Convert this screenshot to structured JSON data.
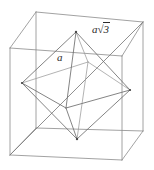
{
  "figure": {
    "background_color": "#ffffff",
    "line_color": "#7c7c7c",
    "label_color": "#2b2b2b",
    "width": 154,
    "height": 170,
    "labels": {
      "edge": {
        "name": "edge-length-label",
        "text": "a",
        "meaning": "octahedron edge length",
        "x": 57,
        "y": 52
      },
      "diagonal": {
        "name": "space-diagonal-label",
        "variable": "a",
        "radical_sign": "√",
        "radicand": "3",
        "text": "a√3",
        "meaning": "cube space diagonal",
        "x": 92,
        "y": 24
      }
    },
    "geometry": {
      "cube": {
        "name": "cube",
        "vertices": {
          "front_bottom_left": [
            10,
            155
          ],
          "front_bottom_right": [
            122,
            160
          ],
          "front_top_right": [
            122,
            56
          ],
          "front_top_left": [
            10,
            48
          ],
          "back_bottom_left": [
            36,
            128
          ],
          "back_bottom_right": [
            143,
            131
          ],
          "back_top_right": [
            143,
            22
          ],
          "back_top_left": [
            36,
            12
          ]
        },
        "edges": [
          [
            "front_bottom_left",
            "front_bottom_right"
          ],
          [
            "front_bottom_right",
            "front_top_right"
          ],
          [
            "front_top_right",
            "front_top_left"
          ],
          [
            "front_top_left",
            "front_bottom_left"
          ],
          [
            "back_bottom_left",
            "back_bottom_right"
          ],
          [
            "back_bottom_right",
            "back_top_right"
          ],
          [
            "back_top_right",
            "back_top_left"
          ],
          [
            "back_top_left",
            "back_bottom_left"
          ],
          [
            "front_bottom_left",
            "back_bottom_left"
          ],
          [
            "front_bottom_right",
            "back_bottom_right"
          ],
          [
            "front_top_right",
            "back_top_right"
          ],
          [
            "front_top_left",
            "back_top_left"
          ]
        ]
      },
      "octahedron": {
        "name": "octahedron",
        "vertices": {
          "top": [
            76,
            32
          ],
          "bottom": [
            77,
            139
          ],
          "left": [
            22,
            83
          ],
          "right": [
            130,
            90
          ],
          "front": [
            66,
            108
          ],
          "back": [
            88,
            62
          ]
        },
        "edges": [
          [
            "top",
            "left"
          ],
          [
            "top",
            "right"
          ],
          [
            "top",
            "front"
          ],
          [
            "top",
            "back"
          ],
          [
            "bottom",
            "left"
          ],
          [
            "bottom",
            "right"
          ],
          [
            "bottom",
            "front"
          ],
          [
            "bottom",
            "back"
          ],
          [
            "left",
            "front"
          ],
          [
            "front",
            "right"
          ],
          [
            "right",
            "back"
          ],
          [
            "back",
            "left"
          ]
        ]
      },
      "space_diagonal": {
        "name": "space-diagonal",
        "from": [
          10,
          155
        ],
        "to": [
          143,
          22
        ]
      }
    }
  }
}
